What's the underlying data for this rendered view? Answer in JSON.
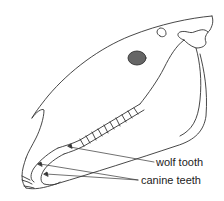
{
  "figure": {
    "labels": [
      {
        "id": "wolf-tooth",
        "text": "wolf tooth"
      },
      {
        "id": "canine-teeth",
        "text": "canine teeth"
      }
    ]
  },
  "colors": {
    "line": "#333333",
    "background": "#ffffff",
    "text": "#222222"
  }
}
